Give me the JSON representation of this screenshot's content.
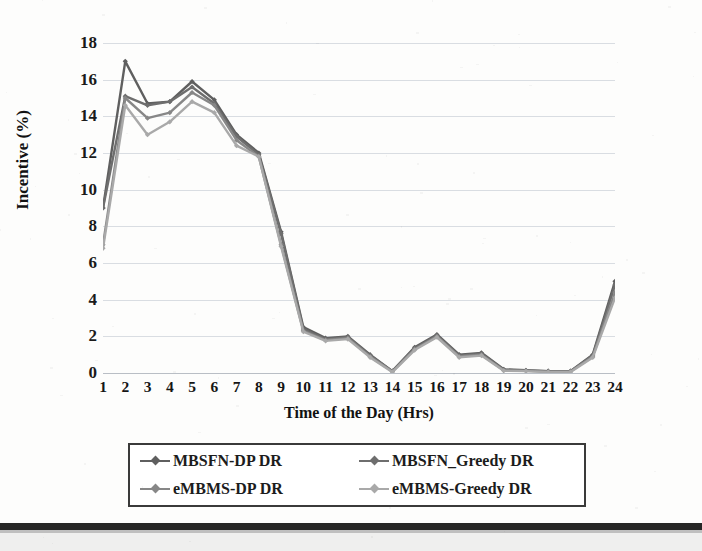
{
  "chart_data": {
    "type": "line",
    "title": "",
    "xlabel": "Time of the Day (Hrs)",
    "ylabel": "Incentive (%)",
    "x": [
      1,
      2,
      3,
      4,
      5,
      6,
      7,
      8,
      9,
      10,
      11,
      12,
      13,
      14,
      15,
      16,
      17,
      18,
      19,
      20,
      21,
      22,
      23,
      24
    ],
    "xticklabels": [
      "1",
      "2",
      "3",
      "4",
      "5",
      "6",
      "7",
      "8",
      "9",
      "10",
      "11",
      "12",
      "13",
      "14",
      "15",
      "16",
      "17",
      "18",
      "19",
      "20",
      "21",
      "22",
      "23",
      "24"
    ],
    "yticklabels": [
      "0",
      "2",
      "4",
      "6",
      "8",
      "10",
      "12",
      "14",
      "16",
      "18"
    ],
    "yticks": [
      0,
      2,
      4,
      6,
      8,
      10,
      12,
      14,
      16,
      18
    ],
    "ylim": [
      0,
      18
    ],
    "xlim": [
      1,
      24
    ],
    "grid": true,
    "grid_axis": "y",
    "legend_position": "below-plot",
    "legend_border": true,
    "marker": "diamond",
    "series": [
      {
        "name": "MBSFN-DP DR",
        "color": "#5f5f5f",
        "values": [
          9.0,
          17.0,
          14.7,
          14.8,
          15.9,
          14.9,
          13.0,
          12.0,
          7.7,
          2.5,
          1.9,
          2.0,
          1.0,
          0.1,
          1.4,
          2.1,
          1.0,
          1.1,
          0.2,
          0.15,
          0.1,
          0.1,
          1.0,
          5.0
        ]
      },
      {
        "name": "MBSFN_Greedy DR",
        "color": "#6e6e6e",
        "values": [
          9.0,
          15.1,
          14.6,
          14.8,
          15.6,
          14.7,
          12.9,
          11.9,
          7.6,
          2.4,
          1.85,
          1.95,
          0.95,
          0.1,
          1.35,
          2.05,
          0.95,
          1.05,
          0.18,
          0.13,
          0.1,
          0.1,
          0.95,
          4.8
        ]
      },
      {
        "name": "eMBMS-DP DR",
        "color": "#878787",
        "values": [
          7.0,
          15.0,
          13.9,
          14.2,
          15.3,
          14.6,
          12.7,
          11.8,
          7.0,
          2.3,
          1.8,
          1.9,
          0.9,
          0.08,
          1.3,
          2.0,
          0.9,
          1.0,
          0.15,
          0.12,
          0.08,
          0.08,
          0.9,
          4.4
        ]
      },
      {
        "name": "eMBMS-Greedy DR",
        "color": "#a9a9a9",
        "values": [
          6.8,
          14.6,
          13.0,
          13.7,
          14.8,
          14.2,
          12.4,
          11.8,
          6.9,
          2.25,
          1.75,
          1.85,
          0.85,
          0.05,
          1.25,
          1.95,
          0.85,
          0.95,
          0.12,
          0.1,
          0.05,
          0.05,
          0.85,
          4.1
        ]
      }
    ]
  },
  "legend": {
    "entries": [
      {
        "label": "MBSFN-DP DR"
      },
      {
        "label": "MBSFN_Greedy DR"
      },
      {
        "label": "eMBMS-DP DR"
      },
      {
        "label": "eMBMS-Greedy DR"
      }
    ]
  },
  "axes": {
    "y_title": "Incentive (%)",
    "x_title": "Time of the Day (Hrs)"
  }
}
